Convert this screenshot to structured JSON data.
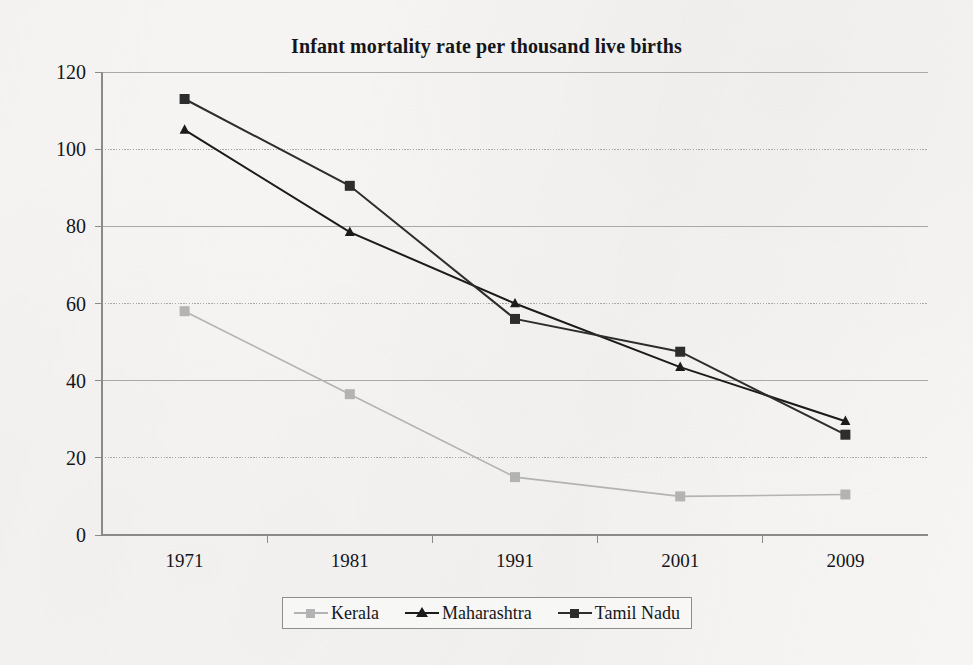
{
  "chart_data": {
    "type": "line",
    "title": "Infant mortality rate per thousand live births",
    "xlabel": "",
    "ylabel": "",
    "categories": [
      "1971",
      "1981",
      "1991",
      "2001",
      "2009"
    ],
    "series": [
      {
        "name": "Kerala",
        "values": [
          58,
          36.5,
          15,
          10,
          10.5
        ],
        "color": "#b3b3b3",
        "marker": "square"
      },
      {
        "name": "Maharashtra",
        "values": [
          105,
          78.5,
          60,
          43.5,
          29.5
        ],
        "color": "#1b1b1b",
        "marker": "triangle"
      },
      {
        "name": "Tamil Nadu",
        "values": [
          113,
          90.5,
          56,
          47.5,
          26
        ],
        "color": "#2d2d2d",
        "marker": "square"
      }
    ],
    "ylim": [
      0,
      120
    ],
    "yticks": [
      0,
      20,
      40,
      60,
      80,
      100,
      120
    ],
    "ytick_labels": [
      "0",
      "20",
      "40",
      "60",
      "80",
      "100",
      "120"
    ],
    "grid": true,
    "grid_axis": "y",
    "legend_position": "bottom"
  },
  "legend": {
    "entries": [
      {
        "label": "Kerala"
      },
      {
        "label": "Maharashtra"
      },
      {
        "label": "Tamil Nadu"
      }
    ]
  },
  "axes": {
    "y_axis_name": "infant-mortality-rate",
    "x_axis_name": "year"
  },
  "colors": {
    "background": "#f6f5f3",
    "axis": "#8a8a8a",
    "grid": "#a9a9a9",
    "text": "#15161a",
    "kerala": "#b3b3b3",
    "maharashtra": "#1b1b1b",
    "tamil_nadu": "#2d2d2d"
  }
}
